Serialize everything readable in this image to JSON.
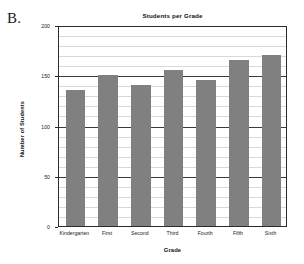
{
  "panel": {
    "letter": "B."
  },
  "chart_data": {
    "type": "bar",
    "title": "Students per Grade",
    "xlabel": "Grade",
    "ylabel": "Number of Students",
    "categories": [
      "Kindergarten",
      "First",
      "Second",
      "Third",
      "Fourth",
      "Fifth",
      "Sixth"
    ],
    "values": [
      135,
      150,
      140,
      155,
      145,
      165,
      170
    ],
    "ylim": [
      0,
      200
    ],
    "ytick_labels": [
      "0",
      "50",
      "100",
      "150",
      "200"
    ],
    "ytick_values": [
      0,
      50,
      100,
      150,
      200
    ],
    "major_gridline_interval": 50,
    "minor_gridline_interval": 10,
    "grid": true,
    "legend": false,
    "bar_color": "#808080",
    "axis_color": "#2b2b2b",
    "minor_grid_color": "#d8d8d8",
    "major_grid_color": "#3a3a3a",
    "background_color": "#ffffff"
  }
}
